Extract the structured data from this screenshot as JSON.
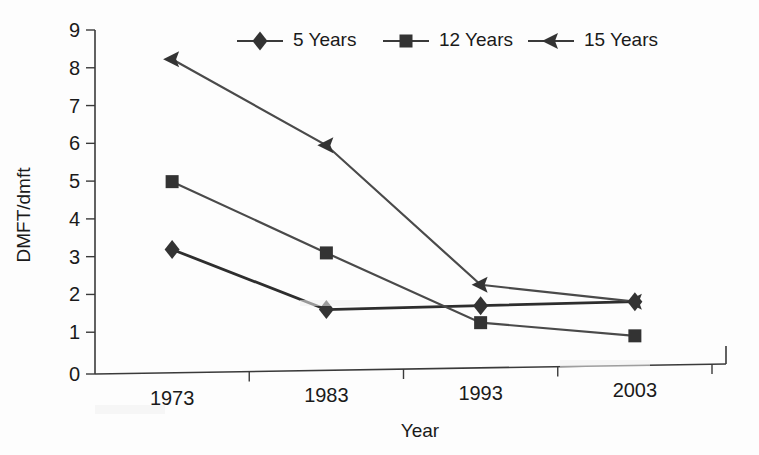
{
  "chart_data": {
    "type": "line",
    "title": "",
    "xlabel": "Year",
    "ylabel": "DMFT/dmft",
    "categories": [
      "1973",
      "1983",
      "1993",
      "2003"
    ],
    "x": [
      1973,
      1983,
      1993,
      2003
    ],
    "ylim": [
      0,
      9
    ],
    "yticks": [
      "0",
      "1",
      "2",
      "3",
      "4",
      "5",
      "6",
      "7",
      "8",
      "9"
    ],
    "ytick_values": [
      0,
      1,
      2,
      3,
      4,
      5,
      6,
      7,
      8,
      9
    ],
    "grid": false,
    "legend_position": "top",
    "series": [
      {
        "name": "5 Years",
        "marker": "diamond",
        "values": [
          3.2,
          1.6,
          1.7,
          1.8
        ]
      },
      {
        "name": "12 Years",
        "marker": "square",
        "values": [
          5.0,
          3.1,
          1.25,
          0.9
        ]
      },
      {
        "name": "15 Years",
        "marker": "triangle",
        "values": [
          8.25,
          5.95,
          2.25,
          1.8
        ]
      }
    ]
  },
  "colors": {
    "ink": "#333333",
    "axis": "#3a3a3a",
    "background": "#fdfdfd"
  }
}
